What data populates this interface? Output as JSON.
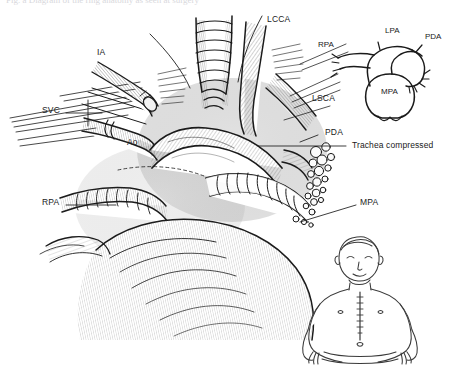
{
  "figure": {
    "background_color": "#ffffff",
    "ink_color": "#1a1a1a",
    "label_color": "#1a1a1a",
    "top_cropped_text": "Fig.  a  Diagram  of  the  ring  anatomy  as  seen  at  surgery"
  },
  "main_labels": [
    {
      "id": "ia",
      "text": "IA",
      "x": 97,
      "y": 52,
      "leader": false
    },
    {
      "id": "lcca",
      "text": "LCCA",
      "x": 267,
      "y": 19,
      "leader": false
    },
    {
      "id": "lsca",
      "text": "LSCA",
      "x": 312,
      "y": 98,
      "leader": false
    },
    {
      "id": "svc",
      "text": "SVC",
      "x": 42,
      "y": 110,
      "leader": true
    },
    {
      "id": "ao",
      "text": "Ao",
      "x": 127,
      "y": 142,
      "leader": false
    },
    {
      "id": "rpa",
      "text": "RPA",
      "x": 42,
      "y": 202,
      "leader": true
    },
    {
      "id": "pda",
      "text": "PDA",
      "x": 325,
      "y": 132,
      "leader": true
    },
    {
      "id": "trachea",
      "text": "Trachea compressed",
      "x": 352,
      "y": 145,
      "leader": true
    },
    {
      "id": "mpa",
      "text": "MPA",
      "x": 360,
      "y": 202,
      "leader": true
    }
  ],
  "inset_labels": [
    {
      "id": "inset-rpa",
      "text": "RPA",
      "x": 318,
      "y": 45
    },
    {
      "id": "inset-lpa",
      "text": "LPA",
      "x": 385,
      "y": 31
    },
    {
      "id": "inset-pda",
      "text": "PDA",
      "x": 425,
      "y": 37
    },
    {
      "id": "inset-mpa",
      "text": "MPA",
      "x": 389,
      "y": 92
    }
  ],
  "inset": {
    "name": "pulmonary-artery-schematic",
    "description": "Schematic of main pulmonary artery branching into right and left pulmonary arteries with patent ductus arteriosus"
  },
  "patient_figure": {
    "name": "infant-torso-drawing",
    "description": "Line drawing of an infant torso with median sternotomy incision"
  }
}
